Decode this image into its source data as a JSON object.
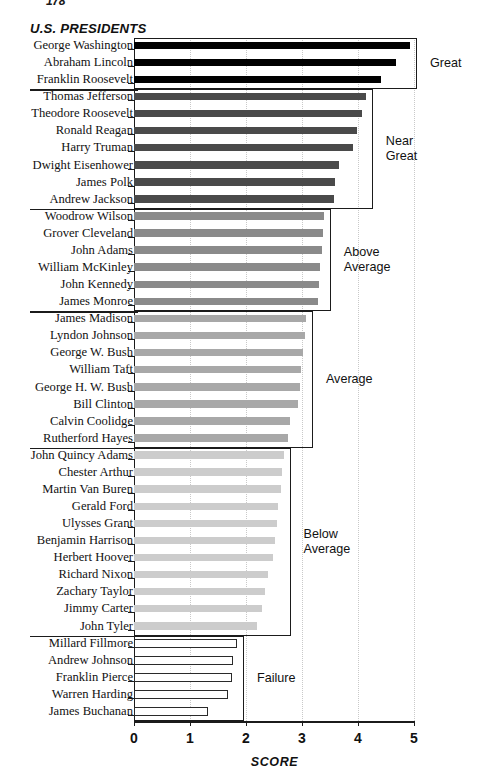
{
  "page_number": "178",
  "chart_data": {
    "type": "bar",
    "orientation": "horizontal",
    "title": "U.S. PRESIDENTS",
    "xlabel": "SCORE",
    "ylabel": "",
    "xlim": [
      0,
      5
    ],
    "xticks": [
      0,
      1,
      2,
      3,
      4,
      5
    ],
    "xtick_labels": [
      "0",
      "1",
      "2",
      "3",
      "4",
      "5"
    ],
    "grid": "vertical-dotted",
    "legend_position": "right-brackets",
    "categories": [
      "George Washington",
      "Abraham Lincoln",
      "Franklin Roosevelt",
      "Thomas Jefferson",
      "Theodore Roosevelt",
      "Ronald Reagan",
      "Harry Truman",
      "Dwight Eisenhower",
      "James Polk",
      "Andrew Jackson",
      "Woodrow Wilson",
      "Grover Cleveland",
      "John Adams",
      "William McKinley",
      "John Kennedy",
      "James Monroe",
      "James Madison",
      "Lyndon Johnson",
      "George W. Bush",
      "William Taft",
      "George H. W. Bush",
      "Bill Clinton",
      "Calvin Coolidge",
      "Rutherford Hayes",
      "John Quincy Adams",
      "Chester Arthur",
      "Martin Van Buren",
      "Gerald Ford",
      "Ulysses Grant",
      "Benjamin Harrison",
      "Herbert Hoover",
      "Richard Nixon",
      "Zachary Taylor",
      "Jimmy Carter",
      "John Tyler",
      "Millard Fillmore",
      "Andrew Johnson",
      "Franklin Pierce",
      "Warren Harding",
      "James Buchanan"
    ],
    "values": [
      4.93,
      4.68,
      4.41,
      4.14,
      4.07,
      3.98,
      3.91,
      3.66,
      3.59,
      3.57,
      3.39,
      3.37,
      3.35,
      3.33,
      3.3,
      3.28,
      3.07,
      3.05,
      3.02,
      2.98,
      2.96,
      2.93,
      2.78,
      2.75,
      2.67,
      2.65,
      2.62,
      2.58,
      2.55,
      2.52,
      2.48,
      2.4,
      2.34,
      2.28,
      2.2,
      1.84,
      1.77,
      1.75,
      1.67,
      1.33
    ],
    "groups": [
      {
        "label": "Great",
        "start": 0,
        "count": 3,
        "color": "#000000"
      },
      {
        "label": "Near\nGreat",
        "start": 3,
        "count": 7,
        "color": "#4a4a4a"
      },
      {
        "label": "Above\nAverage",
        "start": 10,
        "count": 6,
        "color": "#8a8a8a"
      },
      {
        "label": "Average",
        "start": 16,
        "count": 8,
        "color": "#a8a8a8"
      },
      {
        "label": "Below\nAverage",
        "start": 24,
        "count": 11,
        "color": "#cccccc"
      },
      {
        "label": "Failure",
        "start": 35,
        "count": 5,
        "color": "#ffffff"
      }
    ]
  }
}
